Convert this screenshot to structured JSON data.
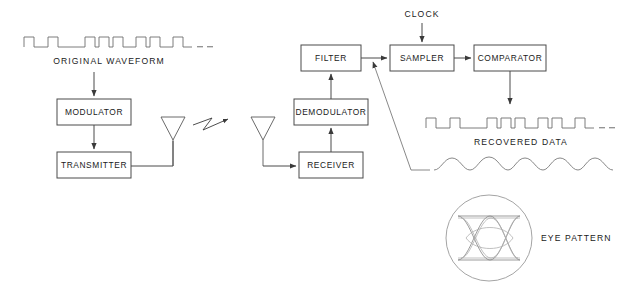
{
  "diagram": {
    "blocks": [
      {
        "id": "modulator",
        "label": "MODULATOR",
        "x": 57,
        "y": 99,
        "w": 74,
        "h": 26
      },
      {
        "id": "transmitter",
        "label": "TRANSMITTER",
        "x": 57,
        "y": 152,
        "w": 74,
        "h": 26
      },
      {
        "id": "receiver",
        "label": "RECEIVER",
        "x": 299,
        "y": 152,
        "w": 64,
        "h": 26
      },
      {
        "id": "demodulator",
        "label": "DEMODULATOR",
        "x": 294,
        "y": 99,
        "w": 74,
        "h": 26
      },
      {
        "id": "filter",
        "label": "FILTER",
        "x": 301,
        "y": 45,
        "w": 60,
        "h": 26
      },
      {
        "id": "sampler",
        "label": "SAMPLER",
        "x": 390,
        "y": 45,
        "w": 64,
        "h": 26
      },
      {
        "id": "comparator",
        "label": "COMPARATOR",
        "x": 474,
        "y": 45,
        "w": 72,
        "h": 26
      }
    ],
    "labels": {
      "clock": "CLOCK",
      "original_waveform": "ORIGINAL  WAVEFORM",
      "recovered_data": "RECOVERED DATA",
      "eye_pattern": "EYE PATTERN"
    },
    "signals": {
      "original_waveform": {
        "name": "ORIGINAL  WAVEFORM",
        "type": "digital-square",
        "bits": [
          1,
          0,
          1,
          0,
          0,
          1,
          1,
          0,
          1,
          0,
          1,
          0,
          1,
          0,
          1,
          0
        ],
        "trailing": "dashes"
      },
      "recovered_data": {
        "name": "RECOVERED DATA",
        "type": "digital-square",
        "bits": [
          1,
          0,
          1,
          0,
          0,
          1,
          1,
          0,
          1,
          0,
          1,
          0,
          1,
          0,
          1,
          0
        ],
        "trailing": "dashes"
      },
      "filtered_analog": {
        "name": "filtered analog signal",
        "type": "analog-sinusoidal",
        "cycles": 7
      }
    },
    "antennas": [
      {
        "id": "tx-antenna",
        "x": 173,
        "y": 128
      },
      {
        "id": "rx-antenna",
        "x": 263,
        "y": 128
      }
    ],
    "rf_link": {
      "id": "rf-lightning-bolt",
      "direction": "left-to-right"
    },
    "eye_pattern": {
      "label": "EYE PATTERN",
      "cx": 489,
      "cy": 238,
      "r": 43
    },
    "colors": {
      "line": "#4a4a4a",
      "text": "#1a1a1a",
      "wave": "#6e6e6e",
      "eye": "#8a8a8a",
      "background": "#ffffff"
    }
  }
}
